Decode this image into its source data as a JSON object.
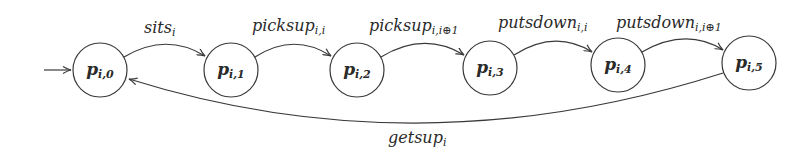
{
  "diagram": {
    "type": "state-machine",
    "initial_state": "p_{i,0}",
    "colors": {
      "stroke": "#3a3a3a",
      "text": "#2a2a2a",
      "background": "#ffffff"
    },
    "nodes": [
      {
        "id": "p0",
        "base": "p",
        "sub": "i,0",
        "cx": 100,
        "cy": 70
      },
      {
        "id": "p1",
        "base": "p",
        "sub": "i,1",
        "cx": 231,
        "cy": 70
      },
      {
        "id": "p2",
        "base": "p",
        "sub": "i,2",
        "cx": 357,
        "cy": 70
      },
      {
        "id": "p3",
        "base": "p",
        "sub": "i,3",
        "cx": 490,
        "cy": 68
      },
      {
        "id": "p4",
        "base": "p",
        "sub": "i,4",
        "cx": 618,
        "cy": 65
      },
      {
        "id": "p5",
        "base": "p",
        "sub": "i,5",
        "cx": 749,
        "cy": 63
      }
    ],
    "edges": [
      {
        "from": "p0",
        "to": "p1",
        "base": "sits",
        "sub": "i"
      },
      {
        "from": "p1",
        "to": "p2",
        "base": "picksup",
        "sub": "i,i"
      },
      {
        "from": "p2",
        "to": "p3",
        "base": "picksup",
        "sub": "i,i⊕1"
      },
      {
        "from": "p3",
        "to": "p4",
        "base": "putsdown",
        "sub": "i,i"
      },
      {
        "from": "p4",
        "to": "p5",
        "base": "putsdown",
        "sub": "i,i⊕1"
      },
      {
        "from": "p5",
        "to": "p0",
        "base": "getsup",
        "sub": "i"
      }
    ]
  }
}
